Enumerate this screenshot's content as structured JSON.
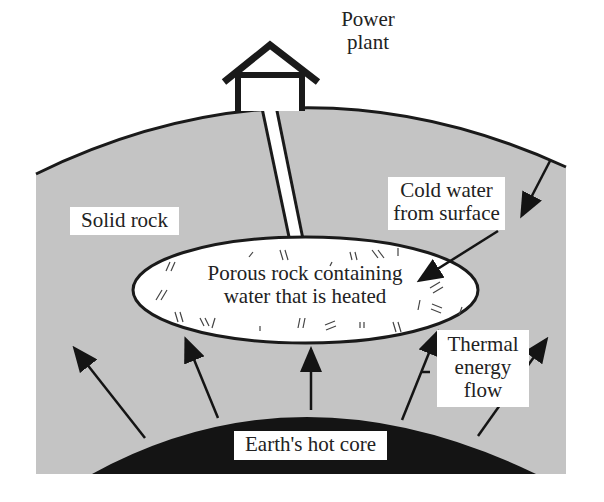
{
  "diagram": {
    "labels": {
      "power_plant_line1": "Power",
      "power_plant_line2": "plant",
      "solid_rock": "Solid rock",
      "cold_water_line1": "Cold water",
      "cold_water_line2": "from surface",
      "porous_line1": "Porous rock containing",
      "porous_line2": "water that is heated",
      "thermal_line1": "Thermal",
      "thermal_line2": "energy",
      "thermal_line3": "flow",
      "core": "Earth's hot core"
    },
    "icons": {
      "power_plant": "house-icon",
      "pipe": "pipe-icon",
      "arrows": "arrow-icon"
    },
    "colors": {
      "rock": "#c4c4c4",
      "core": "#141414",
      "outline": "#1a1a1a",
      "reservoir": "#ffffff",
      "background": "#ffffff"
    }
  }
}
